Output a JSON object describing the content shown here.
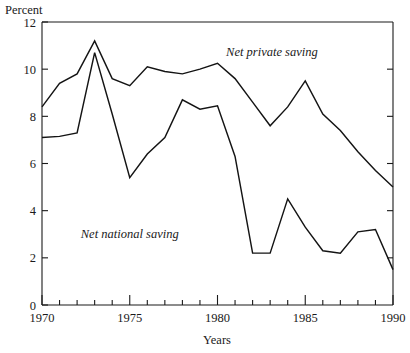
{
  "chart_data": {
    "type": "line",
    "title": "",
    "xlabel": "Years",
    "ylabel": "Percent",
    "ylim": [
      0,
      12
    ],
    "xlim": [
      1970,
      1990
    ],
    "grid": false,
    "legend_position": "inline-annotation",
    "yticks": [
      0,
      2,
      4,
      6,
      8,
      10,
      12
    ],
    "ytick_labels": [
      "0",
      "2",
      "4",
      "6",
      "8",
      "10",
      "12"
    ],
    "xticks": [
      1970,
      1975,
      1980,
      1985,
      1990
    ],
    "xtick_labels": [
      "1970",
      "1975",
      "1980",
      "1985",
      "1990"
    ],
    "x_minor_ticks": [
      1971,
      1972,
      1973,
      1974,
      1976,
      1977,
      1978,
      1979,
      1981,
      1982,
      1983,
      1984,
      1986,
      1987,
      1988,
      1989
    ],
    "x": [
      1970,
      1971,
      1972,
      1973,
      1974,
      1975,
      1976,
      1977,
      1978,
      1979,
      1980,
      1981,
      1982,
      1983,
      1984,
      1985,
      1986,
      1987,
      1988,
      1989,
      1990
    ],
    "series": [
      {
        "name": "Net private saving",
        "label": "Net private saving",
        "values": [
          8.4,
          9.4,
          9.8,
          11.2,
          9.6,
          9.3,
          10.1,
          9.9,
          9.8,
          10.0,
          10.25,
          9.6,
          8.6,
          7.6,
          8.4,
          9.5,
          8.1,
          7.4,
          6.5,
          5.7,
          5.0
        ]
      },
      {
        "name": "Net national saving",
        "label": "Net national saving",
        "values": [
          7.1,
          7.15,
          7.3,
          10.7,
          8.1,
          5.4,
          6.4,
          7.1,
          8.7,
          8.3,
          8.45,
          6.3,
          2.2,
          2.2,
          4.5,
          3.3,
          2.3,
          2.2,
          3.1,
          3.2,
          1.5
        ]
      }
    ],
    "annotations": [
      {
        "text": "Net private saving",
        "x": 1983.1,
        "y": 10.55,
        "style": "italic"
      },
      {
        "text": "Net national saving",
        "x": 1975.0,
        "y": 2.85,
        "style": "italic"
      }
    ],
    "colors": {
      "line": "#141414",
      "axis": "#1a1a1a",
      "background": "#ffffff"
    }
  },
  "axes": {
    "y_unit_label": "Percent",
    "x_axis_title": "Years"
  }
}
